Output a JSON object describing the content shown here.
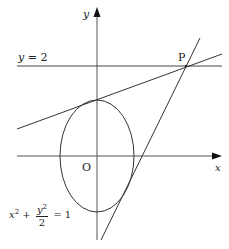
{
  "diagram": {
    "type": "coordinate-geometry",
    "axes": {
      "x_label": "x",
      "y_label": "y",
      "origin_label": "O"
    },
    "horizontal_line": {
      "label": "y = 2",
      "label_lhs": "y",
      "label_eq": "=",
      "label_rhs": "2"
    },
    "point": {
      "label": "P"
    },
    "ellipse": {
      "equation": "x^2 + y^2/2 = 1",
      "term1_base": "x",
      "term1_exp": "2",
      "plus": "+",
      "frac_num_base": "y",
      "frac_num_exp": "2",
      "frac_den": "2",
      "equals": "=",
      "rhs": "1"
    },
    "tangent_lines": 2,
    "colors": {
      "stroke": "#333333",
      "text": "#222222",
      "background": "#ffffff"
    }
  }
}
